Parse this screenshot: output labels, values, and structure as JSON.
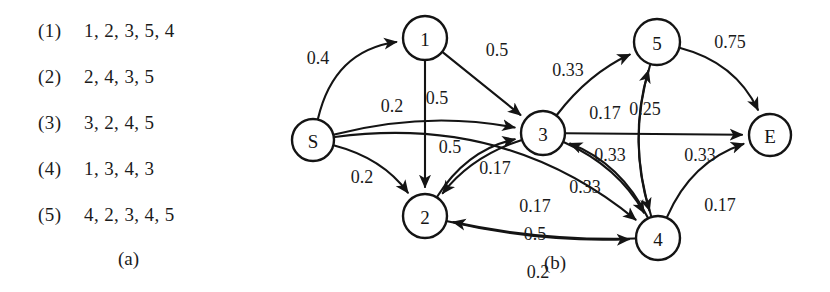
{
  "figure": {
    "panel_a": {
      "caption": "(a)",
      "rows": [
        {
          "index": "(1)",
          "items": "1, 2, 3, 5, 4"
        },
        {
          "index": "(2)",
          "items": "2, 4, 3, 5"
        },
        {
          "index": "(3)",
          "items": "3, 2, 4, 5"
        },
        {
          "index": "(4)",
          "items": "1, 3, 4, 3"
        },
        {
          "index": "(5)",
          "items": "4, 2, 3, 4, 5"
        }
      ]
    },
    "panel_b": {
      "caption": "(b)",
      "colors": {
        "stroke": "#141414",
        "fill": "#ffffff",
        "text": "#1b1b1b"
      },
      "nodes": [
        {
          "id": "S",
          "label": "S",
          "cx": 33,
          "cy": 140,
          "r": 21
        },
        {
          "id": "1",
          "label": "1",
          "cx": 145,
          "cy": 38,
          "r": 22
        },
        {
          "id": "2",
          "label": "2",
          "cx": 145,
          "cy": 216,
          "r": 22
        },
        {
          "id": "3",
          "label": "3",
          "cx": 263,
          "cy": 133,
          "r": 22
        },
        {
          "id": "4",
          "label": "4",
          "cx": 378,
          "cy": 238,
          "r": 22
        },
        {
          "id": "5",
          "label": "5",
          "cx": 377,
          "cy": 42,
          "r": 23
        },
        {
          "id": "E",
          "label": "E",
          "cx": 490,
          "cy": 135,
          "r": 21
        }
      ],
      "edges": [
        {
          "from": "S",
          "to": "1",
          "weight": "0.4",
          "lx": 38,
          "ly": 58
        },
        {
          "from": "S",
          "to": "3",
          "weight": "0.2",
          "lx": 112,
          "ly": 106
        },
        {
          "from": "S",
          "to": "2",
          "weight": "0.2",
          "lx": 82,
          "ly": 177
        },
        {
          "from": "S",
          "to": "4",
          "weight": "0.2",
          "lx": 258,
          "ly": 272
        },
        {
          "from": "1",
          "to": "3",
          "weight": "0.5",
          "lx": 217,
          "ly": 50
        },
        {
          "from": "1",
          "to": "2",
          "weight": "0.5",
          "lx": 157,
          "ly": 98
        },
        {
          "from": "2",
          "to": "3",
          "weight": "0.5",
          "lx": 170,
          "ly": 147
        },
        {
          "from": "3",
          "to": "2",
          "weight": "0.17",
          "lx": 215,
          "ly": 168
        },
        {
          "from": "3",
          "to": "5",
          "weight": "0.33",
          "lx": 288,
          "ly": 70
        },
        {
          "from": "3",
          "to": "E",
          "weight": "0.17",
          "lx": 325,
          "ly": 113
        },
        {
          "from": "5",
          "to": "4",
          "weight": "0.25",
          "lx": 365,
          "ly": 109
        },
        {
          "from": "3",
          "to": "4",
          "weight": "0.33",
          "lx": 330,
          "ly": 155
        },
        {
          "from": "4",
          "to": "3",
          "weight": "0.33",
          "lx": 305,
          "ly": 187
        },
        {
          "from": "4",
          "to": "5",
          "weight": "0.33",
          "lx": 420,
          "ly": 155
        },
        {
          "from": "5",
          "to": "E",
          "weight": "0.75",
          "lx": 450,
          "ly": 42
        },
        {
          "from": "4",
          "to": "E",
          "weight": "0.17",
          "lx": 440,
          "ly": 205
        },
        {
          "from": "4",
          "to": "2",
          "weight": "0.17",
          "lx": 255,
          "ly": 206
        },
        {
          "from": "2",
          "to": "4",
          "weight": "0.5",
          "lx": 255,
          "ly": 234
        }
      ],
      "caption_pos": {
        "x": 275,
        "y": 262
      }
    }
  }
}
